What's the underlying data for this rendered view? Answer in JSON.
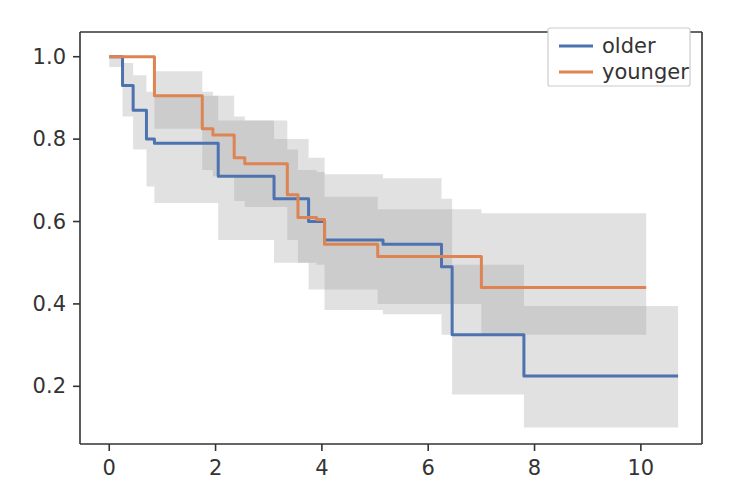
{
  "chart_data": {
    "type": "line",
    "title": "",
    "subtitle": "",
    "xlabel": "",
    "ylabel": "",
    "xlim": [
      -0.55,
      11.15
    ],
    "ylim": [
      0.06,
      1.06
    ],
    "xticks": [
      0,
      2,
      4,
      6,
      8,
      10
    ],
    "xtick_labels": [
      "0",
      "2",
      "4",
      "6",
      "8",
      "10"
    ],
    "yticks": [
      0.2,
      0.4,
      0.6,
      0.8,
      1.0
    ],
    "ytick_labels": [
      "0.2",
      "0.4",
      "0.6",
      "0.8",
      "1.0"
    ],
    "grid": false,
    "legend_position": "upper right",
    "step_style": "post",
    "series": [
      {
        "name": "older",
        "color": "#4c72b0",
        "band_color": "#9a9a9a",
        "band_alpha": 0.3,
        "x": [
          0.0,
          0.25,
          0.45,
          0.7,
          0.85,
          1.9,
          2.05,
          2.9,
          3.1,
          3.55,
          3.75,
          4.05,
          4.95,
          5.15,
          6.05,
          6.25,
          6.45,
          7.55,
          7.8,
          10.7
        ],
        "y": [
          1.0,
          0.93,
          0.87,
          0.8,
          0.79,
          0.79,
          0.71,
          0.71,
          0.655,
          0.655,
          0.6,
          0.555,
          0.555,
          0.545,
          0.545,
          0.49,
          0.325,
          0.325,
          0.225,
          0.225
        ],
        "band_lower": [
          0.975,
          0.855,
          0.775,
          0.685,
          0.645,
          0.645,
          0.555,
          0.555,
          0.5,
          0.5,
          0.435,
          0.385,
          0.385,
          0.375,
          0.375,
          0.325,
          0.18,
          0.18,
          0.1,
          0.1
        ],
        "band_upper": [
          1.0,
          0.985,
          0.955,
          0.915,
          0.905,
          0.905,
          0.845,
          0.845,
          0.8,
          0.8,
          0.755,
          0.715,
          0.715,
          0.705,
          0.705,
          0.655,
          0.495,
          0.495,
          0.395,
          0.395
        ]
      },
      {
        "name": "younger",
        "color": "#dd8452",
        "band_color": "#9a9a9a",
        "band_alpha": 0.3,
        "x": [
          0.0,
          0.85,
          1.75,
          1.95,
          2.35,
          2.55,
          3.35,
          3.55,
          3.9,
          4.05,
          4.9,
          5.05,
          6.8,
          7.0,
          10.1
        ],
        "y": [
          1.0,
          0.905,
          0.825,
          0.81,
          0.755,
          0.74,
          0.665,
          0.61,
          0.605,
          0.545,
          0.545,
          0.515,
          0.515,
          0.44,
          0.44
        ],
        "band_lower": [
          1.0,
          0.825,
          0.725,
          0.71,
          0.65,
          0.635,
          0.555,
          0.5,
          0.495,
          0.435,
          0.435,
          0.4,
          0.4,
          0.325,
          0.325
        ],
        "band_upper": [
          1.0,
          0.965,
          0.915,
          0.905,
          0.855,
          0.845,
          0.775,
          0.725,
          0.72,
          0.66,
          0.66,
          0.63,
          0.63,
          0.62,
          0.62
        ]
      }
    ]
  },
  "legend": {
    "entries": [
      {
        "label": "older",
        "color": "#4c72b0"
      },
      {
        "label": "younger",
        "color": "#dd8452"
      }
    ],
    "frame_color": "#cccccc",
    "background": "#ffffff"
  },
  "axes": {
    "spine_color": "#333333",
    "tick_color": "#333333",
    "background": "#ffffff"
  }
}
